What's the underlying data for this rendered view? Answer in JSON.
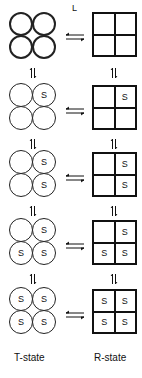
{
  "diagram": {
    "ligand_label": "L",
    "site_label": "S",
    "t_state_label": "T-state",
    "r_state_label": "R-state",
    "rows": [
      {
        "t_bound": [
          false,
          false,
          false,
          false
        ],
        "r_bound": [
          false,
          false,
          false,
          false
        ]
      },
      {
        "t_bound": [
          false,
          true,
          false,
          false
        ],
        "r_bound": [
          false,
          true,
          false,
          false
        ]
      },
      {
        "t_bound": [
          false,
          true,
          false,
          true
        ],
        "r_bound": [
          false,
          true,
          false,
          true
        ]
      },
      {
        "t_bound": [
          false,
          true,
          true,
          true
        ],
        "r_bound": [
          false,
          true,
          true,
          true
        ]
      },
      {
        "t_bound": [
          true,
          true,
          true,
          true
        ],
        "r_bound": [
          true,
          true,
          true,
          true
        ]
      }
    ],
    "colors": {
      "stroke": "#111111",
      "background": "#ffffff"
    }
  }
}
